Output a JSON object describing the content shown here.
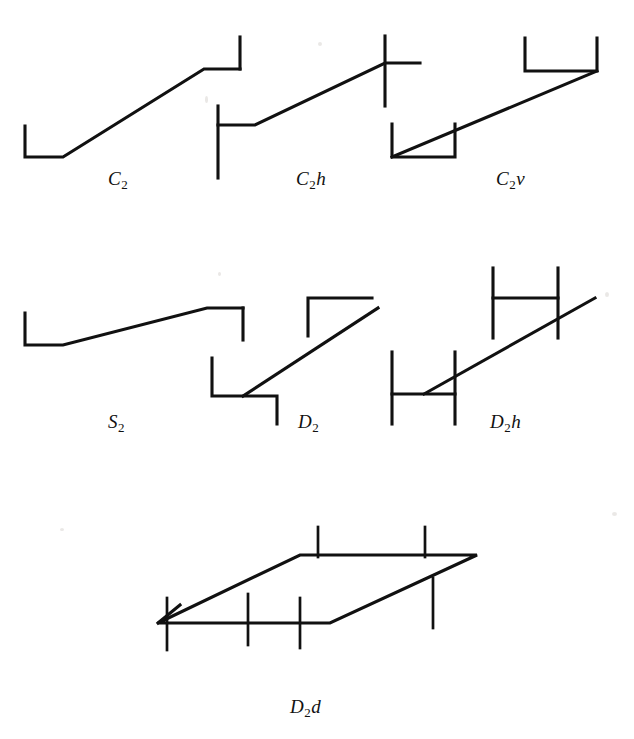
{
  "figure": {
    "kind": "point-group-symmetry-diagram",
    "background_color": "#ffffff",
    "ink_color": "#111111",
    "width": 634,
    "height": 739,
    "rows": [
      {
        "row_index": 0,
        "items": [
          {
            "id": "c2",
            "base": "C",
            "subscript": "2",
            "suffix": "",
            "label_text": "C2",
            "label_x": 112,
            "label_y": 172
          },
          {
            "id": "c2h",
            "base": "C",
            "subscript": "2",
            "suffix": "h",
            "label_text": "C2h",
            "label_x": 298,
            "label_y": 172
          },
          {
            "id": "c2v",
            "base": "C",
            "subscript": "2",
            "suffix": "v",
            "label_text": "C2v",
            "label_x": 498,
            "label_y": 172
          }
        ]
      },
      {
        "row_index": 1,
        "items": [
          {
            "id": "s2",
            "base": "S",
            "subscript": "2",
            "suffix": "",
            "label_text": "S2",
            "label_x": 112,
            "label_y": 415
          },
          {
            "id": "d2",
            "base": "D",
            "subscript": "2",
            "suffix": "",
            "label_text": "D2",
            "label_x": 300,
            "label_y": 415
          },
          {
            "id": "d2h",
            "base": "D",
            "subscript": "2",
            "suffix": "h",
            "label_text": "D2h",
            "label_x": 492,
            "label_y": 415
          }
        ]
      },
      {
        "row_index": 2,
        "items": [
          {
            "id": "d2d",
            "base": "D",
            "subscript": "2",
            "suffix": "d",
            "label_text": "D2d",
            "label_x": 292,
            "label_y": 700
          }
        ]
      }
    ],
    "labels": [
      {
        "name": "label-c2",
        "base": "C",
        "subscript": "2",
        "suffix": ""
      },
      {
        "name": "label-c2h",
        "base": "C",
        "subscript": "2",
        "suffix": "h"
      },
      {
        "name": "label-c2v",
        "base": "C",
        "subscript": "2",
        "suffix": "v"
      },
      {
        "name": "label-s2",
        "base": "S",
        "subscript": "2",
        "suffix": ""
      },
      {
        "name": "label-d2",
        "base": "D",
        "subscript": "2",
        "suffix": ""
      },
      {
        "name": "label-d2h",
        "base": "D",
        "subscript": "2",
        "suffix": "h"
      },
      {
        "name": "label-d2d",
        "base": "D",
        "subscript": "2",
        "suffix": "d"
      }
    ],
    "geometry": {
      "c2": {
        "note": "L bracket lower-left, rising diagonal, horizontal ledge and upward tick at upper-right",
        "paths": [
          "M 25 126 L 25 157 L 63 157 L 204 69 L 240 69",
          "M 240 69 L 240 37"
        ]
      },
      "c2h": {
        "note": "full vertical through lower-left ledge, rising diagonal, full vertical through upper-right ledge",
        "paths": [
          "M 218 125 L 255 125 L 385 63 L 420 63",
          "M 218 106 L 218 178",
          "M 385 36 L 385 106"
        ]
      },
      "c2v": {
        "note": "U bracket lower-left opening up, rising diagonal, inverted U upper-right",
        "paths": [
          "M 392 124 L 392 157 L 455 157 L 455 124",
          "M 392 157 L 597 71",
          "M 525 38 L 525 71 L 597 71 L 597 38"
        ]
      },
      "s2": {
        "note": "L bracket lower-left, rising diagonal, ledge with downward tick at upper-right",
        "paths": [
          "M 25 313 L 25 345 L 63 345 L 207 308 L 243 308",
          "M 243 308 L 243 340"
        ]
      },
      "d2": {
        "note": "Z shapes at both ends: lower-left vertical down + ledge + down tick, upper-right mirrored",
        "paths": [
          "M 212 358 L 212 396 L 277 396 L 277 424",
          "M 243 396 L 378 308",
          "M 308 336 L 308 298 L 372 298"
        ]
      },
      "d2h": {
        "note": "H shapes at both ends with crossing verticals and short interior diagonals",
        "paths": [
          "M 392 352 L 392 424",
          "M 455 352 L 455 424",
          "M 392 394 L 455 394",
          "M 424 394 L 595 298",
          "M 493 268 L 493 338",
          "M 493 298 L 558 298",
          "M 558 268 L 558 338"
        ]
      },
      "d2d": {
        "note": "parallelogram in perspective with six vertical tick marks",
        "parallelogram": "M 158 623 L 300 555 L 477 555 L 330 623 Z",
        "ticks": [
          "M 167 600 L 167 648",
          "M 290 580 L 290 628",
          "M 240 596 L 240 645",
          "M 310 528 L 310 556",
          "M 420 528 L 420 556",
          "M 432 580 L 432 628"
        ],
        "extra": "M 158 623 L 178 605"
      }
    }
  }
}
